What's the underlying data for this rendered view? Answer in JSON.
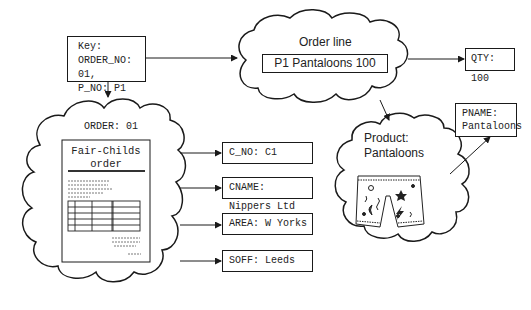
{
  "key_box": {
    "line1": "Key:",
    "line2": "ORDER_NO: 01,",
    "line3": "P_NO: P1"
  },
  "order_line": {
    "title": "Order line",
    "record": "P1 Pantaloons 100"
  },
  "qty_box": {
    "text": "QTY: 100"
  },
  "product": {
    "title_line1": "Product:",
    "title_line2": "Pantaloons",
    "image": "pantaloons-drawing"
  },
  "pname_box": {
    "line1": "PNAME:",
    "line2": "Pantaloons"
  },
  "order": {
    "title": "ORDER: 01",
    "document": {
      "title_line1": "Fair-Childs",
      "title_line2": "order"
    }
  },
  "attributes": [
    {
      "text": "C_NO: C1"
    },
    {
      "text": "CNAME: Nippers Ltd"
    },
    {
      "text": "AREA: W Yorks"
    },
    {
      "text": "SOFF: Leeds"
    }
  ]
}
